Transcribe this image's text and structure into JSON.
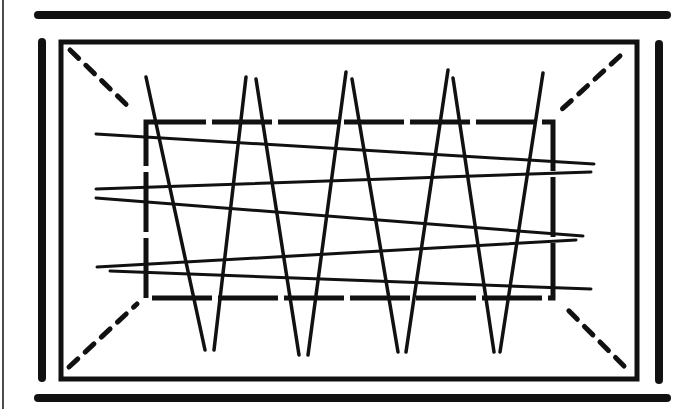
{
  "diagram": {
    "title": "",
    "colors": {
      "ink": "#111111",
      "background": "#ffffff"
    },
    "outer_bars": [
      {
        "name": "top-bar",
        "x1": 38,
        "y1": 15,
        "x2": 667,
        "y2": 15,
        "w": 8
      },
      {
        "name": "bottom-bar",
        "x1": 38,
        "y1": 398,
        "x2": 667,
        "y2": 398,
        "w": 8
      },
      {
        "name": "left-bar",
        "x1": 42,
        "y1": 42,
        "x2": 42,
        "y2": 378,
        "w": 8
      },
      {
        "name": "right-bar",
        "x1": 659,
        "y1": 44,
        "x2": 659,
        "y2": 380,
        "w": 8
      }
    ],
    "frame_rect": {
      "x": 61,
      "y": 42,
      "w": 576,
      "h": 337,
      "w_stroke": 5
    },
    "inner_rect": {
      "x": 146,
      "y": 122,
      "w": 407,
      "h": 176,
      "w_stroke": 5
    },
    "dashed_diagonals": [
      {
        "x1": 70,
        "y1": 50,
        "x2": 132,
        "y2": 110
      },
      {
        "x1": 620,
        "y1": 56,
        "x2": 560,
        "y2": 111
      },
      {
        "x1": 69,
        "y1": 367,
        "x2": 137,
        "y2": 304
      },
      {
        "x1": 624,
        "y1": 366,
        "x2": 564,
        "y2": 306
      }
    ],
    "horizontal_lines": [
      {
        "x1": 96,
        "y1": 134,
        "x2": 594,
        "y2": 164
      },
      {
        "x1": 96,
        "y1": 189,
        "x2": 591,
        "y2": 172
      },
      {
        "x1": 96,
        "y1": 198,
        "x2": 583,
        "y2": 236
      },
      {
        "x1": 97,
        "y1": 267,
        "x2": 576,
        "y2": 240
      },
      {
        "x1": 110,
        "y1": 271,
        "x2": 591,
        "y2": 289
      }
    ],
    "zigzag_lines": [
      {
        "x1": 146,
        "y1": 77,
        "x2": 205,
        "y2": 350
      },
      {
        "x1": 246,
        "y1": 77,
        "x2": 214,
        "y2": 350
      },
      {
        "x1": 256,
        "y1": 79,
        "x2": 299,
        "y2": 355
      },
      {
        "x1": 346,
        "y1": 72,
        "x2": 308,
        "y2": 355
      },
      {
        "x1": 352,
        "y1": 79,
        "x2": 398,
        "y2": 352
      },
      {
        "x1": 448,
        "y1": 70,
        "x2": 406,
        "y2": 352
      },
      {
        "x1": 453,
        "y1": 78,
        "x2": 494,
        "y2": 352
      },
      {
        "x1": 543,
        "y1": 73,
        "x2": 500,
        "y2": 352
      }
    ],
    "border_line": {
      "x1": 3,
      "y1": 0,
      "x2": 3,
      "y2": 409
    }
  }
}
